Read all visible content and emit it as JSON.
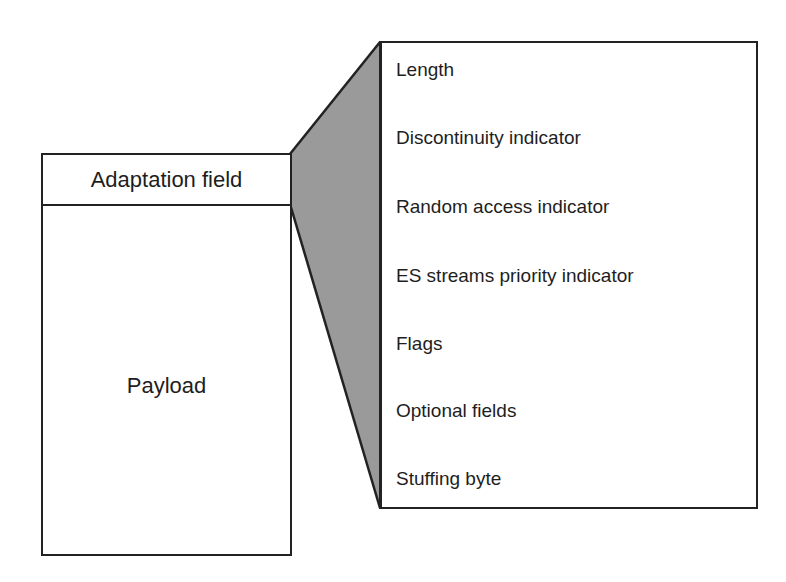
{
  "diagram": {
    "type": "transport-stream-packet-structure",
    "packet": {
      "adaptation_field_label": "Adaptation field",
      "payload_label": "Payload"
    },
    "adaptation_field_contents": {
      "items": [
        {
          "label": "Length"
        },
        {
          "label": "Discontinuity indicator"
        },
        {
          "label": "Random access indicator"
        },
        {
          "label": "ES streams priority indicator"
        },
        {
          "label": "Flags"
        },
        {
          "label": "Optional fields"
        },
        {
          "label": "Stuffing byte"
        }
      ]
    },
    "colors": {
      "wedge_fill": "#9a9a9a",
      "stroke": "#222222",
      "background": "#ffffff",
      "text": "#1e1e1e"
    }
  }
}
